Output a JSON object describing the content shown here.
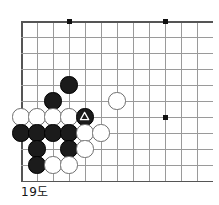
{
  "diagram": {
    "caption": "19도",
    "kind": "go-board-diagram",
    "colors": {
      "black_stone": "#1b1b1b",
      "white_stone": "#ffffff",
      "white_stone_border": "#6e6e6e",
      "grid_line": "#9a9a9a",
      "border_line": "#555555",
      "background": "#ffffff",
      "caption_text": "#151515"
    },
    "board": {
      "origin_x": 21,
      "origin_y": 21,
      "spacing": 16,
      "columns": 12,
      "rows": 11,
      "left_edge_is_board_edge": true,
      "top_edge_is_board_edge": true,
      "bottom_edge_row": 11,
      "right_edge_clipped": true,
      "stone_radius": 8.6
    },
    "star_points": [
      {
        "col": 4,
        "row": 1
      },
      {
        "col": 10,
        "row": 1
      },
      {
        "col": 10,
        "row": 7
      }
    ],
    "stones": [
      {
        "id": "b1",
        "color": "black",
        "col": 4,
        "row": 5,
        "mark": ""
      },
      {
        "id": "b2",
        "color": "black",
        "col": 3,
        "row": 6,
        "mark": ""
      },
      {
        "id": "w1",
        "color": "white",
        "col": 1,
        "row": 7,
        "mark": ""
      },
      {
        "id": "w2",
        "color": "white",
        "col": 2,
        "row": 7,
        "mark": ""
      },
      {
        "id": "w3",
        "color": "white",
        "col": 3,
        "row": 7,
        "mark": ""
      },
      {
        "id": "w4",
        "color": "white",
        "col": 4,
        "row": 7,
        "mark": ""
      },
      {
        "id": "b3",
        "color": "black",
        "col": 5,
        "row": 7,
        "mark": "triangle"
      },
      {
        "id": "w5",
        "color": "white",
        "col": 7,
        "row": 6,
        "mark": ""
      },
      {
        "id": "b4",
        "color": "black",
        "col": 1,
        "row": 8,
        "mark": ""
      },
      {
        "id": "b5",
        "color": "black",
        "col": 2,
        "row": 8,
        "mark": ""
      },
      {
        "id": "b6",
        "color": "black",
        "col": 3,
        "row": 8,
        "mark": ""
      },
      {
        "id": "b7",
        "color": "black",
        "col": 4,
        "row": 8,
        "mark": ""
      },
      {
        "id": "w6",
        "color": "white",
        "col": 5,
        "row": 8,
        "mark": ""
      },
      {
        "id": "w7",
        "color": "white",
        "col": 6,
        "row": 8,
        "mark": ""
      },
      {
        "id": "b8",
        "color": "black",
        "col": 2,
        "row": 9,
        "mark": ""
      },
      {
        "id": "b9",
        "color": "black",
        "col": 4,
        "row": 9,
        "mark": ""
      },
      {
        "id": "w8",
        "color": "white",
        "col": 5,
        "row": 9,
        "mark": ""
      },
      {
        "id": "b10",
        "color": "black",
        "col": 2,
        "row": 10,
        "mark": ""
      },
      {
        "id": "w9",
        "color": "white",
        "col": 3,
        "row": 10,
        "mark": ""
      },
      {
        "id": "w10",
        "color": "white",
        "col": 4,
        "row": 10,
        "mark": ""
      }
    ]
  }
}
